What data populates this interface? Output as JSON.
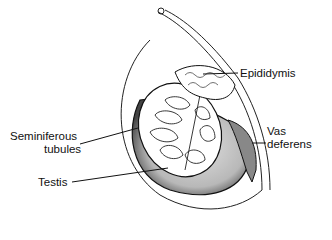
{
  "diagram": {
    "labels": {
      "epididymis": "Epididymis",
      "seminiferous_line1": "Seminiferous",
      "seminiferous_line2": "tubules",
      "testis": "Testis",
      "vas_line1": "Vas",
      "vas_line2": "deferens"
    },
    "colors": {
      "ink": "#111111",
      "shade": "#bdbdbd",
      "background": "#ffffff"
    }
  }
}
